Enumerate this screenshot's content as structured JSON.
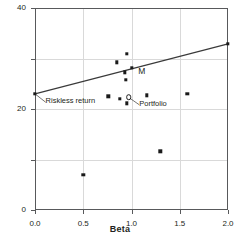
{
  "chart_data": {
    "type": "scatter",
    "title": "",
    "xlabel": "Beta",
    "ylabel": "Total return",
    "xlim": [
      0.0,
      2.0
    ],
    "ylim": [
      -40,
      40
    ],
    "xticks": [
      0.0,
      0.5,
      1.0,
      1.5,
      2.0
    ],
    "xtick_labels": [
      "0.0",
      "0.5",
      "1.0",
      "1.5",
      "2.0"
    ],
    "yticks": [
      -40,
      -20,
      0,
      20,
      40
    ],
    "ytick_labels": [
      "-40",
      "-20",
      "0",
      "20",
      "40"
    ],
    "grid": true,
    "legend": "none",
    "series": [
      {
        "name": "securities",
        "marker": "filled-square",
        "points": [
          {
            "x": 0.0,
            "y": 6.0
          },
          {
            "x": 0.5,
            "y": -26.0
          },
          {
            "x": 0.76,
            "y": 5.0
          },
          {
            "x": 0.85,
            "y": 18.5
          },
          {
            "x": 0.88,
            "y": 4.0
          },
          {
            "x": 0.93,
            "y": 14.5
          },
          {
            "x": 0.94,
            "y": 11.5
          },
          {
            "x": 0.95,
            "y": 21.8
          },
          {
            "x": 0.95,
            "y": 2.2
          },
          {
            "x": 1.0,
            "y": 16.2
          },
          {
            "x": 1.16,
            "y": 5.5
          },
          {
            "x": 1.3,
            "y": -16.8
          },
          {
            "x": 1.58,
            "y": 6.0
          },
          {
            "x": 2.0,
            "y": 25.8
          }
        ]
      },
      {
        "name": "portfolio",
        "marker": "open-circle",
        "points": [
          {
            "x": 0.97,
            "y": 4.6
          }
        ]
      }
    ],
    "line": {
      "name": "security-market-line",
      "from": {
        "x": 0.0,
        "y": 6.0
      },
      "to": {
        "x": 2.0,
        "y": 25.8
      }
    },
    "annotations": [
      {
        "id": "riskless-return",
        "text": "Riskless return",
        "target": {
          "x": 0.0,
          "y": 6.0
        },
        "label_pos": {
          "x": 0.11,
          "y": 1.5
        }
      },
      {
        "id": "portfolio",
        "text": "Portfolio",
        "target": {
          "x": 0.97,
          "y": 4.6
        },
        "label_pos": {
          "x": 1.08,
          "y": 0.5
        }
      },
      {
        "id": "market-portfolio",
        "text": "M",
        "target": {
          "x": 1.0,
          "y": 16.2
        },
        "label_pos": {
          "x": 1.07,
          "y": 13.5
        }
      }
    ]
  },
  "colors": {
    "marker": "#1a1a1a",
    "axis": "#58595b",
    "grid": "#d9d9d9",
    "text": "#231f20",
    "background": "#ffffff"
  }
}
